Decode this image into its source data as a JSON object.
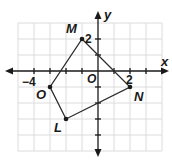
{
  "diagram": {
    "type": "coordinate-plane-polygon",
    "axes": {
      "x_label": "x",
      "y_label": "y",
      "origin_label": "O",
      "x_range": [
        -5,
        4
      ],
      "y_range": [
        -5,
        3
      ],
      "tick_labels": [
        {
          "axis": "x",
          "value": -4,
          "text": "−4"
        },
        {
          "axis": "x",
          "value": 2,
          "text": "2"
        },
        {
          "axis": "y",
          "value": 2,
          "text": "2"
        }
      ]
    },
    "grid": {
      "visible": true,
      "unit": 1,
      "color": "#d9d9d9"
    },
    "polygon": {
      "name": "LMNO",
      "vertices": [
        {
          "label": "M",
          "x": -1,
          "y": 2
        },
        {
          "label": "N",
          "x": 2,
          "y": -1
        },
        {
          "label": "L",
          "x": -2,
          "y": -3
        },
        {
          "label": "O",
          "x": -3,
          "y": -1
        }
      ],
      "order": [
        "M",
        "N",
        "L",
        "O"
      ],
      "stroke": "#2b2b2b"
    },
    "colors": {
      "axis": "#1a1a1a",
      "grid": "#d9d9d9",
      "polygon": "#2b2b2b",
      "background": "#ffffff"
    }
  }
}
